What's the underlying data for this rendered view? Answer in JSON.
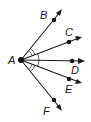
{
  "diagram": {
    "title": "",
    "vertex": {
      "label": "A"
    },
    "rays": [
      {
        "id": "B",
        "label": "B"
      },
      {
        "id": "C",
        "label": "C"
      },
      {
        "id": "D",
        "label": "D"
      },
      {
        "id": "E",
        "label": "E"
      },
      {
        "id": "F",
        "label": "F"
      }
    ],
    "angle_marks": [
      {
        "between": [
          "B",
          "C"
        ],
        "arcs": 2
      },
      {
        "between": [
          "C",
          "E"
        ],
        "arcs": 1
      },
      {
        "between": [
          "E",
          "F"
        ],
        "arcs": 2
      }
    ],
    "colors": {
      "ink": "#1a1a1a",
      "background": "#ffffff"
    }
  }
}
